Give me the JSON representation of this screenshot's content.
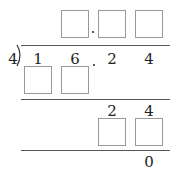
{
  "problem": {
    "divisor": "4",
    "dividend_digits": [
      "1",
      "6",
      "2",
      "4"
    ],
    "decimal_point": "."
  },
  "quotient": {
    "boxes": [
      "",
      "",
      ""
    ]
  },
  "steps": {
    "first_product_boxes": [
      "",
      ""
    ],
    "remainder_digits": [
      "2",
      "4"
    ],
    "second_product_boxes": [
      "",
      ""
    ],
    "final_remainder": "0"
  }
}
